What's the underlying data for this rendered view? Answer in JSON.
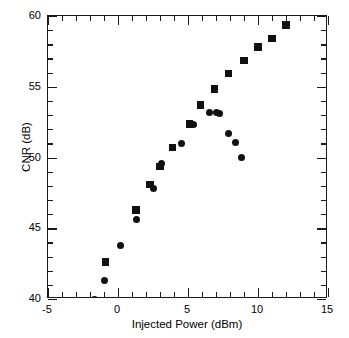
{
  "chart_data": {
    "type": "scatter",
    "title": "",
    "xlabel": "Injected Power (dBm)",
    "ylabel": "CNR (dB)",
    "xlim": [
      -5,
      15
    ],
    "ylim": [
      40,
      60
    ],
    "x_major_ticks": [
      -5,
      0,
      5,
      10,
      15
    ],
    "x_major_tick_labels": [
      "-5",
      "0",
      "5",
      "10",
      "15"
    ],
    "x_minor_tick_step": 1,
    "y_major_ticks": [
      40,
      45,
      50,
      55,
      60
    ],
    "y_major_tick_labels": [
      "40",
      "45",
      "50",
      "55",
      "60"
    ],
    "y_minor_tick_step": 1,
    "grid": false,
    "legend": null,
    "marker_color": "#111111",
    "axis_color": "#1a1a1a",
    "background_color": "#ffffff",
    "series": [
      {
        "name": "circle-series",
        "marker": "circle",
        "points": [
          {
            "x": -1.7,
            "y": 40.0
          },
          {
            "x": -1.0,
            "y": 41.3
          },
          {
            "x": 0.2,
            "y": 43.8
          },
          {
            "x": 1.35,
            "y": 45.6
          },
          {
            "x": 2.5,
            "y": 47.8
          },
          {
            "x": 3.1,
            "y": 49.6
          },
          {
            "x": 4.5,
            "y": 51.0
          },
          {
            "x": 5.4,
            "y": 52.3
          },
          {
            "x": 6.5,
            "y": 53.2
          },
          {
            "x": 7.0,
            "y": 53.15
          },
          {
            "x": 7.25,
            "y": 53.1
          },
          {
            "x": 7.9,
            "y": 51.7
          },
          {
            "x": 8.4,
            "y": 51.05
          },
          {
            "x": 8.8,
            "y": 50.0
          }
        ]
      },
      {
        "name": "square-series",
        "marker": "square",
        "points": [
          {
            "x": -0.9,
            "y": 42.6
          },
          {
            "x": 1.3,
            "y": 46.3
          },
          {
            "x": 2.3,
            "y": 48.1
          },
          {
            "x": 3.0,
            "y": 49.35
          },
          {
            "x": 3.9,
            "y": 50.7
          },
          {
            "x": 5.1,
            "y": 52.35
          },
          {
            "x": 5.9,
            "y": 53.7
          },
          {
            "x": 6.9,
            "y": 54.85
          },
          {
            "x": 7.9,
            "y": 55.95
          },
          {
            "x": 9.0,
            "y": 56.85
          },
          {
            "x": 10.0,
            "y": 57.8
          },
          {
            "x": 11.0,
            "y": 58.4
          },
          {
            "x": 12.0,
            "y": 59.35
          }
        ]
      }
    ]
  }
}
